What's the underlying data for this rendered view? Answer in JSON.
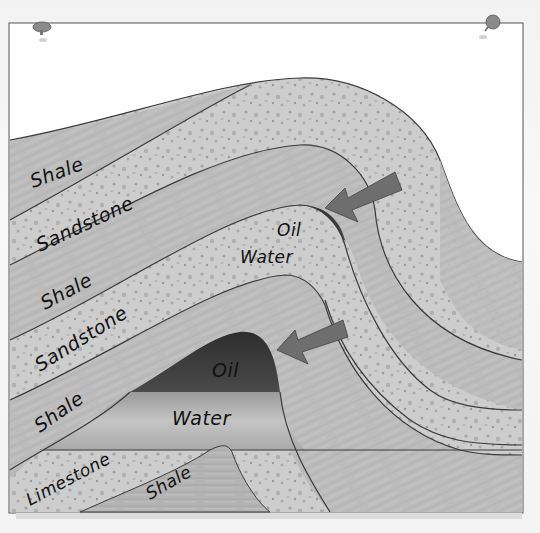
{
  "figure": {
    "type": "geological-cross-section",
    "style": "hand-drawn pencil illustration, grayscale",
    "pins": [
      "top-left-pin",
      "top-right-pin"
    ]
  },
  "labels": {
    "shale_top": "Shale",
    "sandstone_upper": "Sandstone",
    "oil_upper": "Oil",
    "water_upper": "Water",
    "shale_middle": "Shale",
    "sandstone_lower": "Sandstone",
    "oil_lower": "Oil",
    "shale_lower": "Shale",
    "water_lower": "Water",
    "limestone": "Limestone",
    "shale_bottom": "Shale"
  },
  "layers_left_to_right_top_to_bottom": [
    "Shale",
    "Sandstone",
    "Shale",
    "Sandstone",
    "Shale",
    "Limestone",
    "Shale"
  ],
  "traps": [
    {
      "name": "upper-trap",
      "fluid_top": "Oil",
      "fluid_bottom": "Water",
      "arrow": "points to oil at fold crest"
    },
    {
      "name": "lower-trap",
      "fluid_top": "Oil",
      "fluid_bottom": "Water",
      "arrow": "points to oil at fold crest"
    }
  ],
  "colors": {
    "background": "#f4f4f4",
    "frame": "#ffffff",
    "frame_border": "#555555",
    "shale": "#bdbdbd",
    "sandstone": "#cfcfcf",
    "sandstone_speckle": "#a8a8a8",
    "limestone": "#d8d8d8",
    "oil": "#3e3e3e",
    "water": "#a6a6a6",
    "arrow": "#6e6e6e",
    "pin": "#8a8a8a",
    "text": "#111111"
  }
}
